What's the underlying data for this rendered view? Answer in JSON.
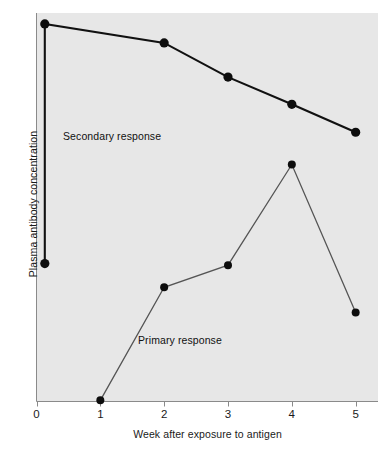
{
  "figure": {
    "background_color": "#ffffff",
    "panel_color": "#e7e7e7",
    "axis_color": "#8a8a8a"
  },
  "axes": {
    "x_label": "Week after exposure to antigen",
    "y_label": "Plasma antibody concentration",
    "x_tick_labels": [
      "0",
      "1",
      "2",
      "3",
      "4",
      "5"
    ]
  },
  "annotations": {
    "secondary": "Secondary response",
    "primary": "Primary response"
  },
  "chart_data": {
    "type": "line",
    "title": "",
    "xlabel": "Week after exposure to antigen",
    "ylabel": "Plasma antibody concentration",
    "xlim": [
      0,
      5.35
    ],
    "ylim": [
      0,
      100
    ],
    "grid": false,
    "legend": "inline-annotations",
    "x_ticks": [
      0,
      1,
      2,
      3,
      4,
      5
    ],
    "y_ticks": [],
    "series": [
      {
        "name": "Secondary response",
        "color": "#111111",
        "line_width": 2.1,
        "marker": "filled-circle",
        "marker_size": 4.6,
        "points": [
          {
            "x": 0.13,
            "y": 35.5
          },
          {
            "x": 0.13,
            "y": 97.2
          },
          {
            "x": 2.0,
            "y": 92.3
          },
          {
            "x": 3.0,
            "y": 83.5
          },
          {
            "x": 4.0,
            "y": 76.5
          },
          {
            "x": 5.0,
            "y": 69.3
          }
        ]
      },
      {
        "name": "Primary response",
        "color": "#555555",
        "line_width": 1.3,
        "marker": "filled-circle",
        "marker_size": 4.0,
        "points": [
          {
            "x": 1.0,
            "y": 0.3
          },
          {
            "x": 2.0,
            "y": 29.4
          },
          {
            "x": 3.0,
            "y": 35.1
          },
          {
            "x": 4.0,
            "y": 61.0
          },
          {
            "x": 5.0,
            "y": 22.9
          }
        ]
      }
    ]
  }
}
